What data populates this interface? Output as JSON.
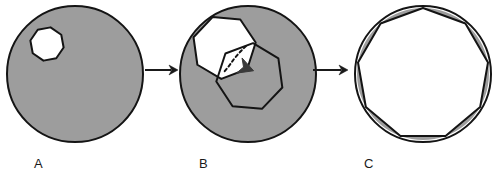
{
  "figure": {
    "type": "scientific-diagram",
    "background_color": "#ffffff",
    "colors": {
      "fill_gray": "#9d9d9d",
      "outline_black": "#141414",
      "hole_white": "#ffffff",
      "arrow_black": "#1a1a1a",
      "label_black": "#1a1a1a"
    }
  },
  "panels": [
    {
      "id": "A",
      "label": "A",
      "label_x": 34,
      "label_y": 168,
      "disc": {
        "cx": 75,
        "cy": 74,
        "r": 68,
        "fill": "#9d9d9d",
        "stroke": "#141414",
        "stroke_width": 2
      },
      "holes": [
        {
          "name": "small-polygon-hole",
          "sides": 8,
          "cx": 47,
          "cy": 44,
          "r": 17,
          "rotation_deg": 12,
          "fill": "#ffffff",
          "stroke": "#141414",
          "stroke_width": 2
        }
      ]
    },
    {
      "id": "B",
      "label": "B",
      "label_x": 199,
      "label_y": 168,
      "disc": {
        "cx": 248,
        "cy": 74,
        "r": 68,
        "fill": "#9d9d9d",
        "stroke": "#141414",
        "stroke_width": 2
      },
      "holes": [
        {
          "name": "white-polygon-hole",
          "sides": 7,
          "cx": 224,
          "cy": 47,
          "r": 32,
          "rotation_deg": -8,
          "fill": "#ffffff",
          "stroke": "#141414",
          "stroke_width": 2
        }
      ],
      "outlines": [
        {
          "name": "expanded-polygon-outline",
          "sides": 7,
          "cx": 250,
          "cy": 77,
          "r": 34,
          "rotation_deg": 18,
          "fill": "none",
          "stroke": "#141414",
          "stroke_width": 2
        }
      ],
      "dashed_path": {
        "name": "growth-direction-dashed-line",
        "points": [
          [
            246,
            46
          ],
          [
            240,
            52
          ],
          [
            234,
            59
          ],
          [
            229,
            66
          ],
          [
            224,
            72
          ]
        ],
        "stroke": "#141414",
        "stroke_width": 2,
        "dash": "3 3"
      },
      "arrow_marker": {
        "name": "growth-direction-arrowhead",
        "x": 246,
        "y": 68,
        "size": 13,
        "angle_deg": 20,
        "fill": "#3a3a3a"
      }
    },
    {
      "id": "C",
      "label": "C",
      "label_x": 364,
      "label_y": 168,
      "disc": {
        "cx": 423,
        "cy": 74,
        "r": 68,
        "fill": "#ffffff",
        "stroke": "#141414",
        "stroke_width": 2
      },
      "ring_polygon": {
        "name": "inscribed-polygon",
        "sides": 9,
        "cx": 423,
        "cy": 74,
        "r": 66,
        "rotation_deg": -90,
        "fill": "#ffffff",
        "stroke": "#141414",
        "stroke_width": 2
      },
      "ring_fill": "#9d9d9d"
    }
  ],
  "arrows": [
    {
      "name": "arrow-a-to-b",
      "x1": 145,
      "y1": 70,
      "x2": 178,
      "y2": 70,
      "stroke": "#1a1a1a",
      "stroke_width": 2,
      "head_size": 9
    },
    {
      "name": "arrow-b-to-c",
      "x1": 313,
      "y1": 70,
      "x2": 348,
      "y2": 70,
      "stroke": "#1a1a1a",
      "stroke_width": 2,
      "head_size": 9
    }
  ],
  "labels": {
    "panel_a": "A",
    "panel_b": "B",
    "panel_c": "C"
  }
}
